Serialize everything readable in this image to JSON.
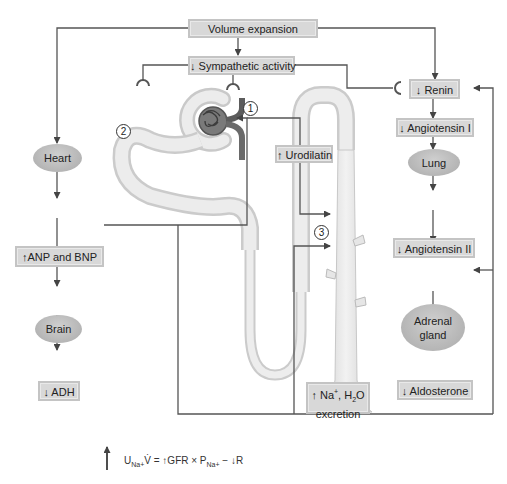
{
  "diagram": {
    "type": "flow diagram",
    "nodes": {
      "volume_expansion": "Volume expansion",
      "sympathetic": "↓ Sympathetic activity",
      "renin": "↓ Renin",
      "angiotensin1": "↓ Angiotensin I",
      "lung": "Lung",
      "angiotensin2": "↓ Angiotensin II",
      "adrenal_line1": "Adrenal",
      "adrenal_line2": "gland",
      "aldosterone": "↓ Aldosterone",
      "heart": "Heart",
      "anp_bnp": "↑ANP and  BNP",
      "brain": "Brain",
      "adh": "↓ ADH",
      "urodilatin": "↑ Urodilatin",
      "excretion_line1_prefix": "↑ Na",
      "excretion_line1_sup": "+",
      "excretion_line1_mid": ", H",
      "excretion_line1_sub": "2",
      "excretion_line1_suffix": "O",
      "excretion_line2": "excretion"
    },
    "markers": {
      "one": "1",
      "two": "2",
      "three": "3"
    },
    "edges": [
      {
        "from": "Volume expansion",
        "to": "↓ Sympathetic activity"
      },
      {
        "from": "Volume expansion",
        "to": "↓ Renin"
      },
      {
        "from": "Volume expansion",
        "to": "Heart"
      },
      {
        "from": "↓ Sympathetic activity",
        "to": "↓ Renin",
        "type": "inhibit"
      },
      {
        "from": "↓ Sympathetic activity",
        "to": "afferent arteriole (1)",
        "type": "inhibit"
      },
      {
        "from": "↓ Sympathetic activity",
        "to": "proximal tubule (2)",
        "type": "inhibit"
      },
      {
        "from": "↓ Renin",
        "to": "↓ Angiotensin I"
      },
      {
        "from": "↓ Angiotensin I",
        "to": "Lung"
      },
      {
        "from": "Lung",
        "to": "↓ Angiotensin II"
      },
      {
        "from": "↓ Angiotensin II",
        "to": "Adrenal gland"
      },
      {
        "from": "Adrenal gland",
        "to": "↓ Aldosterone"
      },
      {
        "from": "↓ Aldosterone",
        "to": "collecting duct (3)"
      },
      {
        "from": "Heart",
        "to": "↑ANP and BNP"
      },
      {
        "from": "↑ANP and BNP",
        "to": "Brain"
      },
      {
        "from": "Brain",
        "to": "↓ ADH"
      },
      {
        "from": "↑ANP and BNP",
        "to": "glomerulus"
      },
      {
        "from": "↑ANP and BNP",
        "to": "↓ Renin"
      },
      {
        "from": "↑ANP and BNP",
        "to": "Adrenal gland"
      },
      {
        "from": "↑ANP and BNP",
        "to": "collecting duct (3)"
      },
      {
        "from": "↑ Urodilatin",
        "to": "collecting duct"
      }
    ],
    "formula": {
      "U": "U",
      "U_sub": "Na+",
      "V": "V̇",
      "rest1": " = ↑GFR × P",
      "P_sub": "Na+",
      "rest2": " − ↓R"
    },
    "colors": {
      "box_fill": "#d8d8d8",
      "oval_fill": "#b8b8b8",
      "line": "#555555",
      "nephron": "#e6e6e6",
      "vessel": "#6e6e6e"
    }
  }
}
